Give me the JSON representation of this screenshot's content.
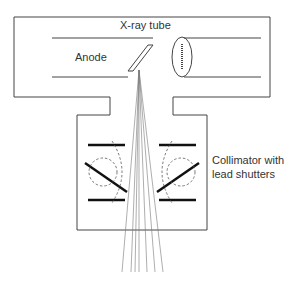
{
  "diagram": {
    "labels": {
      "tube": "X-ray tube",
      "anode": "Anode",
      "collimator_line1": "Collimator with",
      "collimator_line2": "lead shutters"
    },
    "colors": {
      "line": "#444444",
      "shutter": "#111111",
      "beam": "#777777",
      "text": "#333333",
      "background": "#ffffff"
    },
    "components": [
      "x-ray-tube-housing",
      "anode",
      "cathode-filament",
      "collimator-housing",
      "lead-shutters",
      "x-ray-beam"
    ],
    "beam_ray_count": 7
  }
}
